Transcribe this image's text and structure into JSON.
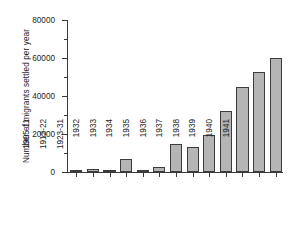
{
  "chart_data": {
    "type": "bar",
    "title": "",
    "xlabel": "",
    "ylabel": "Number of migrants settled per year",
    "categories": [
      "1905-11",
      "1912-22",
      "1923-31",
      "1932",
      "1933",
      "1934",
      "1935",
      "1936",
      "1937",
      "1938",
      "1939",
      "1940",
      "1941"
    ],
    "values": [
      1000,
      1800,
      700,
      7000,
      500,
      2500,
      14500,
      13000,
      19500,
      32000,
      45000,
      52500,
      60000
    ],
    "ylim": [
      0,
      80000
    ],
    "ytick_labels": [
      "0",
      "20000",
      "40000",
      "60000",
      "80000"
    ],
    "ytick_values": [
      0,
      20000,
      40000,
      60000,
      80000
    ],
    "yminor_values": [
      10000,
      30000,
      50000,
      70000
    ],
    "grid": false,
    "legend": false,
    "bar_fill_color": "#b5b5b5",
    "bar_edge_color": "#3c3c3c",
    "axis_color": "#3a3a3a",
    "background_color": "#ffffff"
  }
}
